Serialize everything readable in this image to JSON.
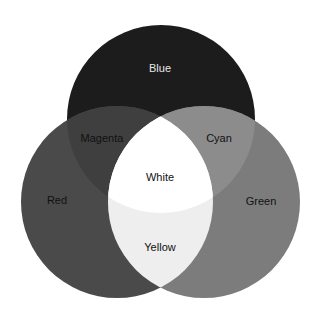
{
  "diagram": {
    "type": "venn",
    "title": "",
    "circles": [
      {
        "id": "blue",
        "label": "Blue",
        "cx": 161,
        "cy": 119,
        "r": 94,
        "fill": "#1c1c1c"
      },
      {
        "id": "red",
        "label": "Red",
        "cx": 117,
        "cy": 202,
        "r": 96,
        "fill": "#4a4a4a"
      },
      {
        "id": "green",
        "label": "Green",
        "cx": 204,
        "cy": 202,
        "r": 96,
        "fill": "#7c7c7c"
      }
    ],
    "regions": {
      "blue": {
        "label": "Blue",
        "x": 160,
        "y": 72,
        "text_color": "#e8e8e8"
      },
      "red": {
        "label": "Red",
        "x": 57,
        "y": 204,
        "text_color": "#111111"
      },
      "green": {
        "label": "Green",
        "x": 261,
        "y": 205,
        "text_color": "#111111"
      },
      "magenta": {
        "label": "Magenta",
        "x": 102,
        "y": 142,
        "fill": "#3f3f3f",
        "text_color": "#111111"
      },
      "cyan": {
        "label": "Cyan",
        "x": 219,
        "y": 142,
        "fill": "#8c8c8c",
        "text_color": "#111111"
      },
      "white": {
        "label": "White",
        "x": 160,
        "y": 181,
        "fill": "#ffffff",
        "text_color": "#111111"
      },
      "yellow": {
        "label": "Yellow",
        "x": 160,
        "y": 251,
        "fill": "#eeeeee",
        "text_color": "#111111"
      }
    }
  }
}
